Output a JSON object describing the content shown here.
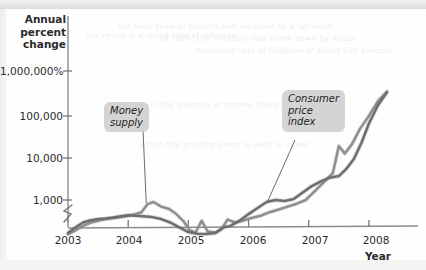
{
  "figure": {
    "y_axis_title": "Annual\npercent\nchange",
    "y_axis_title_lines": [
      "Annual",
      "percent",
      "change"
    ],
    "x_axis_title": "Year"
  },
  "chart_data": {
    "type": "line",
    "title": "",
    "xlabel": "Year",
    "ylabel": "Annual percent change",
    "yscale": "log",
    "grid": false,
    "legend_position": "inline-callouts",
    "axis_break": true,
    "xlim": [
      2003.0,
      2008.35
    ],
    "ylim": [
      100,
      3000000
    ],
    "xticks": [
      "2003",
      "2004",
      "2005",
      "2006",
      "2007",
      "2008"
    ],
    "xtick_values": [
      2003,
      2004,
      2005,
      2006,
      2007,
      2008
    ],
    "yticks": [
      "1,000,000%",
      "100,000",
      "10,000",
      "1,000"
    ],
    "ytick_values": [
      1000000,
      100000,
      10000,
      1000
    ],
    "series": [
      {
        "name": "Money supply",
        "color": "#8f8f8f",
        "callout": [
          "Money",
          "supply"
        ],
        "x": [
          2003.0,
          2003.12,
          2003.25,
          2003.38,
          2003.5,
          2003.62,
          2003.75,
          2003.88,
          2004.0,
          2004.12,
          2004.22,
          2004.32,
          2004.42,
          2004.55,
          2004.68,
          2004.8,
          2004.92,
          2005.02,
          2005.12,
          2005.22,
          2005.32,
          2005.45,
          2005.55,
          2005.65,
          2005.78,
          2005.9,
          2006.05,
          2006.2,
          2006.35,
          2006.5,
          2006.65,
          2006.8,
          2006.95,
          2007.1,
          2007.25,
          2007.4,
          2007.5,
          2007.6,
          2007.72,
          2007.85,
          2008.0,
          2008.15,
          2008.3
        ],
        "values": [
          160,
          195,
          250,
          300,
          330,
          360,
          380,
          400,
          430,
          470,
          520,
          800,
          900,
          700,
          620,
          470,
          320,
          200,
          175,
          330,
          185,
          175,
          210,
          350,
          300,
          330,
          380,
          430,
          520,
          600,
          700,
          820,
          1000,
          1600,
          2600,
          4200,
          18000,
          12000,
          20000,
          45000,
          90000,
          200000,
          330000
        ]
      },
      {
        "name": "Consumer price index",
        "color": "#6e6e6e",
        "callout": [
          "Consumer",
          "price",
          "index"
        ],
        "x": [
          2003.0,
          2003.12,
          2003.25,
          2003.38,
          2003.5,
          2003.62,
          2003.75,
          2003.88,
          2004.0,
          2004.12,
          2004.25,
          2004.4,
          2004.55,
          2004.7,
          2004.85,
          2005.0,
          2005.15,
          2005.3,
          2005.45,
          2005.58,
          2005.7,
          2005.85,
          2006.0,
          2006.15,
          2006.3,
          2006.45,
          2006.6,
          2006.75,
          2006.9,
          2007.05,
          2007.2,
          2007.35,
          2007.5,
          2007.62,
          2007.75,
          2007.88,
          2008.0,
          2008.15,
          2008.3
        ],
        "values": [
          170,
          230,
          300,
          340,
          360,
          370,
          390,
          420,
          440,
          430,
          420,
          400,
          360,
          300,
          230,
          180,
          165,
          162,
          170,
          230,
          250,
          330,
          470,
          650,
          900,
          1000,
          950,
          1050,
          1500,
          2100,
          2700,
          3300,
          3600,
          5200,
          9000,
          22000,
          60000,
          160000,
          320000
        ]
      }
    ],
    "annotations": [
      {
        "text": "Money supply",
        "lines": [
          "Money",
          "supply"
        ],
        "target_x": 2004.3,
        "target_y": 850
      },
      {
        "text": "Consumer price index",
        "lines": [
          "Consumer",
          "price",
          "index"
        ],
        "target_x": 2006.32,
        "target_y": 950
      }
    ]
  },
  "showthrough": {
    "lines": [
      "the next several months and returned to a far more",
      "of 2004, the inflation rate came down by about",
      "moderate rate of inflation of about 100 percent",
      "in the quantity of money drove the price level",
      "which the printing press is used to cover",
      "the result is a rising rate of inflation"
    ]
  }
}
